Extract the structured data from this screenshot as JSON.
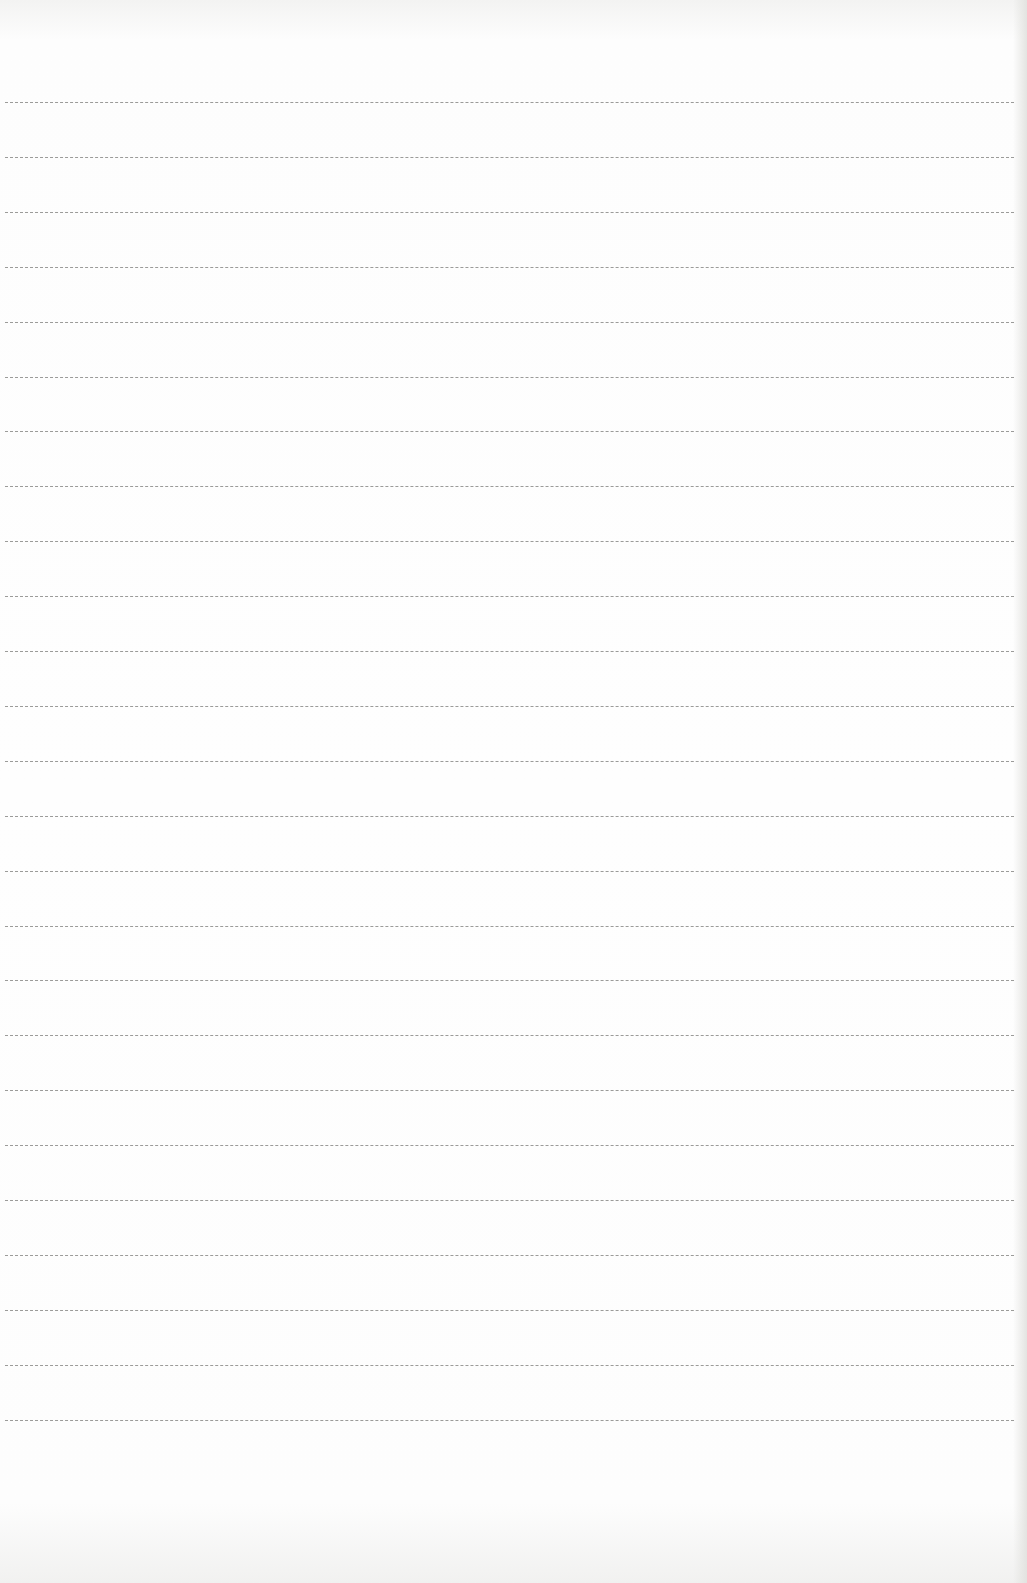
{
  "page": {
    "type": "lined-paper",
    "background_color": "#fdfdfd",
    "line_color": "#8a8a88",
    "line_count": 25,
    "first_line_y": 102,
    "line_spacing": 54.9,
    "text": ""
  }
}
